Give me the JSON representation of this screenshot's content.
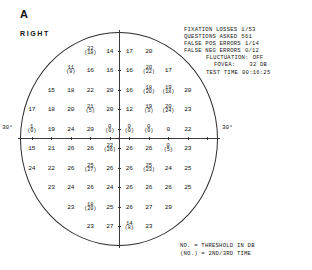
{
  "panel": {
    "letter": "A",
    "eye": "RIGHT"
  },
  "test_info": {
    "fixation_losses_label": "FIXATION LOSSES",
    "fixation_losses_value": "1/53",
    "questions_asked_label": "QUESTIONS ASKED",
    "questions_asked_value": "561",
    "false_pos_label": "FALSE POS ERRORS",
    "false_pos_value": "1/14",
    "false_neg_label": "FALSE NEG ERRORS",
    "false_neg_value": "0/12",
    "fluctuation_label": "FLUCTUATION:",
    "fluctuation_value": "OFF",
    "fovea_label": "FOVEA:",
    "fovea_value": "32 DB",
    "test_time_label": "TEST TIME",
    "test_time_value": "00:16:25"
  },
  "legend": {
    "line1": "NO. = THRESHOLD IN DB",
    "line2": "(NO.) = 2ND/3RD TIME"
  },
  "axis": {
    "left_degree": "30°",
    "right_degree": "30°"
  },
  "chart_data": {
    "type": "scatter",
    "xlabel": "",
    "ylabel": "",
    "units": "dB",
    "xlim": [
      -30,
      30
    ],
    "ylim": [
      -30,
      30
    ],
    "grid": false,
    "legend_position": "bottom-right",
    "points": [
      {
        "x": -9,
        "y": 27,
        "value": 22,
        "retest": 18
      },
      {
        "x": -3,
        "y": 27,
        "value": 14
      },
      {
        "x": 3,
        "y": 27,
        "value": 17
      },
      {
        "x": 9,
        "y": 27,
        "value": 20
      },
      {
        "x": -15,
        "y": 21,
        "value": 11,
        "retest": 8
      },
      {
        "x": -9,
        "y": 21,
        "value": 16
      },
      {
        "x": -3,
        "y": 21,
        "value": 16
      },
      {
        "x": 3,
        "y": 21,
        "value": 16
      },
      {
        "x": 9,
        "y": 21,
        "value": 20,
        "retest": 22
      },
      {
        "x": 15,
        "y": 21,
        "value": 17
      },
      {
        "x": -21,
        "y": 15,
        "value": 15
      },
      {
        "x": -15,
        "y": 15,
        "value": 18
      },
      {
        "x": -9,
        "y": 15,
        "value": 22
      },
      {
        "x": -3,
        "y": 15,
        "value": 20
      },
      {
        "x": 3,
        "y": 15,
        "value": 16
      },
      {
        "x": 9,
        "y": 15,
        "value": 18,
        "retest": 20
      },
      {
        "x": 15,
        "y": 15,
        "value": 19,
        "retest": 18
      },
      {
        "x": 21,
        "y": 15,
        "value": 20
      },
      {
        "x": -27,
        "y": 9,
        "value": 17
      },
      {
        "x": -21,
        "y": 9,
        "value": 18
      },
      {
        "x": -15,
        "y": 9,
        "value": 20
      },
      {
        "x": -9,
        "y": 9,
        "value": 21,
        "retest": 5
      },
      {
        "x": -3,
        "y": 9,
        "value": 20
      },
      {
        "x": 3,
        "y": 9,
        "value": 12
      },
      {
        "x": 9,
        "y": 9,
        "value": 19,
        "retest": 3
      },
      {
        "x": 15,
        "y": 9,
        "value": 20,
        "retest": 24
      },
      {
        "x": 21,
        "y": 9,
        "value": 23
      },
      {
        "x": -27,
        "y": 3,
        "value": 1,
        "retest": 0
      },
      {
        "x": -21,
        "y": 3,
        "value": 19
      },
      {
        "x": -15,
        "y": 3,
        "value": 24
      },
      {
        "x": -9,
        "y": 3,
        "value": 20
      },
      {
        "x": -3,
        "y": 3,
        "value": 0,
        "retest": 0
      },
      {
        "x": 3,
        "y": 3,
        "value": 0,
        "retest": 0
      },
      {
        "x": 9,
        "y": 3,
        "value": 0,
        "retest": 0
      },
      {
        "x": 15,
        "y": 3,
        "value": 0
      },
      {
        "x": 21,
        "y": 3,
        "value": 22
      },
      {
        "x": -27,
        "y": -3,
        "value": 15
      },
      {
        "x": -21,
        "y": -3,
        "value": 21
      },
      {
        "x": -15,
        "y": -3,
        "value": 26
      },
      {
        "x": -9,
        "y": -3,
        "value": 26
      },
      {
        "x": -3,
        "y": -3,
        "value": 22,
        "retest": 26
      },
      {
        "x": 3,
        "y": -3,
        "value": 26
      },
      {
        "x": 9,
        "y": -3,
        "value": 26
      },
      {
        "x": 15,
        "y": -3,
        "value": 0,
        "retest": 5
      },
      {
        "x": 21,
        "y": -3,
        "value": 23
      },
      {
        "x": -27,
        "y": -9,
        "value": 24
      },
      {
        "x": -21,
        "y": -9,
        "value": 22
      },
      {
        "x": -15,
        "y": -9,
        "value": 26
      },
      {
        "x": -9,
        "y": -9,
        "value": 25,
        "retest": 27
      },
      {
        "x": -3,
        "y": -9,
        "value": 26
      },
      {
        "x": 3,
        "y": -9,
        "value": 26
      },
      {
        "x": 9,
        "y": -9,
        "value": 25,
        "retest": 23
      },
      {
        "x": 15,
        "y": -9,
        "value": 24
      },
      {
        "x": 21,
        "y": -9,
        "value": 25
      },
      {
        "x": -21,
        "y": -15,
        "value": 23
      },
      {
        "x": -15,
        "y": -15,
        "value": 24
      },
      {
        "x": -9,
        "y": -15,
        "value": 26
      },
      {
        "x": -3,
        "y": -15,
        "value": 24
      },
      {
        "x": 3,
        "y": -15,
        "value": 26
      },
      {
        "x": 9,
        "y": -15,
        "value": 26
      },
      {
        "x": 15,
        "y": -15,
        "value": 26
      },
      {
        "x": 21,
        "y": -15,
        "value": 25
      },
      {
        "x": -15,
        "y": -21,
        "value": 23
      },
      {
        "x": -9,
        "y": -21,
        "value": 18,
        "retest": 20
      },
      {
        "x": -3,
        "y": -21,
        "value": 25
      },
      {
        "x": 3,
        "y": -21,
        "value": 26
      },
      {
        "x": 9,
        "y": -21,
        "value": 27
      },
      {
        "x": 15,
        "y": -21,
        "value": 29
      },
      {
        "x": -9,
        "y": -27,
        "value": 23
      },
      {
        "x": -3,
        "y": -27,
        "value": 27
      },
      {
        "x": 3,
        "y": -27,
        "value": 14,
        "retest": 8
      },
      {
        "x": 9,
        "y": -27,
        "value": 23
      }
    ]
  }
}
